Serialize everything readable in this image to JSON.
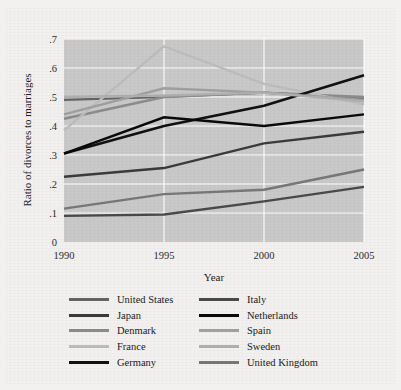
{
  "figure": {
    "background_color": "#f2f1ef",
    "plot_background_color": "#c9c9c9",
    "gridline_color": "#ffffff"
  },
  "chart_data": {
    "type": "line",
    "title": "",
    "xlabel": "Year",
    "ylabel": "Ratio of divorces to marriages",
    "x": [
      1990,
      1995,
      2000,
      2005
    ],
    "xticklabels": [
      "1990",
      "1995",
      "2000",
      "2005"
    ],
    "xlim": [
      1990,
      2005
    ],
    "ylim": [
      0,
      0.7
    ],
    "yticks": [
      0,
      0.1,
      0.2,
      0.3,
      0.4,
      0.5,
      0.6,
      0.7
    ],
    "yticklabels": [
      "0",
      ".1",
      ".2",
      ".3",
      ".4",
      ".5",
      ".6",
      ".7"
    ],
    "grid": true,
    "legend_position": "below-axes",
    "series": [
      {
        "name": "United States",
        "color": "#646464",
        "width": 2.2,
        "values": [
          0.49,
          0.5,
          0.515,
          0.495
        ]
      },
      {
        "name": "Japan",
        "color": "#3b3b3b",
        "width": 2.4,
        "values": [
          0.225,
          0.255,
          0.34,
          0.38
        ]
      },
      {
        "name": "Denmark",
        "color": "#8c8c8c",
        "width": 2.4,
        "values": [
          0.425,
          0.5,
          0.515,
          0.5
        ]
      },
      {
        "name": "France",
        "color": "#bdbdbd",
        "width": 2.4,
        "values": [
          0.385,
          0.675,
          0.545,
          0.475
        ]
      },
      {
        "name": "Germany",
        "color": "#111111",
        "width": 2.6,
        "values": [
          0.305,
          0.4,
          0.47,
          0.575
        ]
      },
      {
        "name": "Italy",
        "color": "#4a4a4a",
        "width": 2.4,
        "values": [
          0.09,
          0.095,
          0.14,
          0.19
        ]
      },
      {
        "name": "Netherlands",
        "color": "#0a0a0a",
        "width": 2.4,
        "values": [
          0.305,
          0.43,
          0.4,
          0.44
        ]
      },
      {
        "name": "Spain",
        "color": "#a0a0a0",
        "width": 2.4,
        "values": [
          0.44,
          0.53,
          0.515,
          0.49
        ]
      },
      {
        "name": "Sweden",
        "color": "#b0b0b0",
        "width": 2.4,
        "values": [
          0.5,
          0.505,
          0.515,
          0.485
        ]
      },
      {
        "name": "United Kingdom",
        "color": "#787878",
        "width": 2.4,
        "values": [
          0.115,
          0.165,
          0.18,
          0.25
        ]
      }
    ]
  },
  "legend": {
    "entries": [
      {
        "label": "United States",
        "color": "#646464"
      },
      {
        "label": "Italy",
        "color": "#4a4a4a"
      },
      {
        "label": "Japan",
        "color": "#3b3b3b"
      },
      {
        "label": "Netherlands",
        "color": "#0a0a0a"
      },
      {
        "label": "Denmark",
        "color": "#8c8c8c"
      },
      {
        "label": "Spain",
        "color": "#a0a0a0"
      },
      {
        "label": "France",
        "color": "#bdbdbd"
      },
      {
        "label": "Sweden",
        "color": "#b0b0b0"
      },
      {
        "label": "Germany",
        "color": "#111111"
      },
      {
        "label": "United Kingdom",
        "color": "#787878"
      }
    ]
  }
}
